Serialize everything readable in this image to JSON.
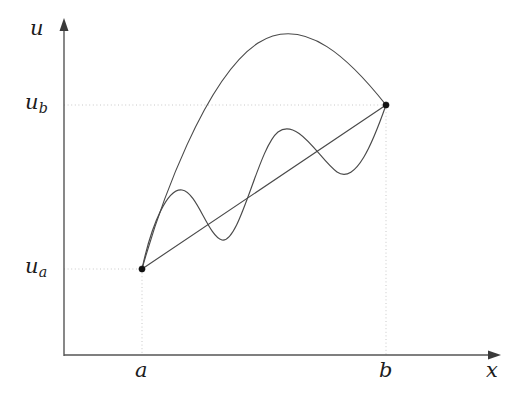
{
  "figure": {
    "kind": "mathematical-diagram",
    "background_color": "#ffffff",
    "curve_color": "#4a4a4a",
    "axis_color": "#555555",
    "guide_color": "#c8c8c8",
    "point_color": "#111111"
  },
  "axes": {
    "vertical": {
      "label": "u",
      "name": "u-axis",
      "x_px": 64,
      "top_px": 22,
      "bottom_px": 356
    },
    "horizontal": {
      "label": "x",
      "name": "x-axis",
      "y_px": 355,
      "left_px": 64,
      "right_px": 497
    }
  },
  "ticks": {
    "x": [
      {
        "label": "a",
        "base": "a",
        "sub": "",
        "x_px": 142
      },
      {
        "label": "b",
        "base": "b",
        "sub": "",
        "x_px": 386
      }
    ],
    "y": [
      {
        "label": "u_b",
        "base": "u",
        "sub": "b",
        "y_px": 105
      },
      {
        "label": "u_a",
        "base": "u",
        "sub": "a",
        "y_px": 269
      }
    ]
  },
  "endpoints": [
    {
      "name": "left-endpoint",
      "x_label": "a",
      "y_label": "u_a",
      "x_px": 142,
      "y_px": 269
    },
    {
      "name": "right-endpoint",
      "x_label": "b",
      "y_label": "u_b",
      "x_px": 386,
      "y_px": 105
    }
  ],
  "guides": [
    {
      "name": "guide-ub-horizontal",
      "orientation": "horizontal",
      "from": [
        64,
        105
      ],
      "to": [
        386,
        105
      ]
    },
    {
      "name": "guide-ua-horizontal",
      "orientation": "horizontal",
      "from": [
        64,
        269
      ],
      "to": [
        142,
        269
      ]
    },
    {
      "name": "guide-a-vertical",
      "orientation": "vertical",
      "from": [
        142,
        269
      ],
      "to": [
        142,
        355
      ]
    },
    {
      "name": "guide-b-vertical",
      "orientation": "vertical",
      "from": [
        386,
        105
      ],
      "to": [
        386,
        355
      ]
    }
  ],
  "curves": [
    {
      "name": "upper-arc-curve",
      "style": "smooth arc rising steeply then cresting",
      "path": "M 142 269 C 160 205, 205 78, 258 43 C 305 13, 352 62, 386 105"
    },
    {
      "name": "oscillating-curve",
      "style": "wavy curve with two oscillations about the chord",
      "path": "M 142 269 C 152 222, 168 188, 182 190 C 197 192, 208 236, 222 240 C 240 244, 258 148, 278 132 C 298 117, 320 160, 337 172 C 356 185, 373 142, 386 105"
    },
    {
      "name": "straight-chord",
      "style": "straight line between the two fixed endpoints",
      "path": "M 142 269 L 386 105"
    }
  ],
  "arrowheads": [
    {
      "name": "u-axis-arrowhead",
      "points": "64,18 59.5,31 68.5,31"
    },
    {
      "name": "x-axis-arrowhead",
      "points": "501,355 488,350.5 488,359.5"
    }
  ]
}
